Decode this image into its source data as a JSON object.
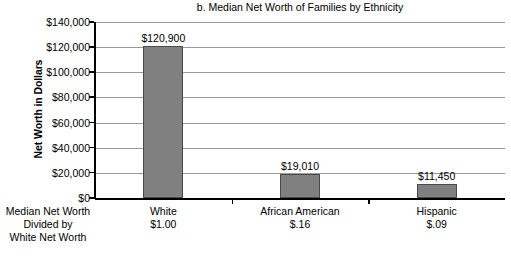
{
  "chart_data": {
    "type": "bar",
    "title": "b. Median Net Worth of Families by Ethnicity",
    "xlabel": "",
    "ylabel": "Net Worth in Dollars",
    "categories": [
      "White",
      "African American",
      "Hispanic"
    ],
    "values": [
      120900,
      19010,
      11450
    ],
    "value_labels": [
      "$120,900",
      "$19,010",
      "$11,450"
    ],
    "secondary_labels": [
      "$1.00",
      "$.16",
      "$.09"
    ],
    "secondary_axis_caption": [
      "Median Net Worth",
      "Divided by",
      "White Net Worth"
    ],
    "ylim": [
      0,
      140000
    ],
    "ytick_values": [
      0,
      20000,
      40000,
      60000,
      80000,
      100000,
      120000,
      140000
    ],
    "ytick_labels": [
      "$0",
      "$20,000",
      "$40,000",
      "$60,000",
      "$80,000",
      "$100,000",
      "$120,000",
      "$140,000"
    ],
    "grid": true,
    "legend": "none",
    "bar_color": "#808080",
    "bar_edge_color": "#4a4a4a",
    "gridline_color": "#9a9a9a",
    "axis_color": "#000000",
    "background_color": "#ffffff"
  }
}
